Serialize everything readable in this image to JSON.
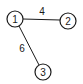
{
  "diagram": {
    "type": "weighted-graph",
    "nodes": [
      {
        "id": "1",
        "label": "1",
        "x": 15,
        "y": 19
      },
      {
        "id": "2",
        "label": "2",
        "x": 68,
        "y": 21
      },
      {
        "id": "3",
        "label": "3",
        "x": 43,
        "y": 72
      }
    ],
    "edges": [
      {
        "from": "1",
        "to": "2",
        "weight": "4"
      },
      {
        "from": "1",
        "to": "3",
        "weight": "6"
      }
    ]
  }
}
